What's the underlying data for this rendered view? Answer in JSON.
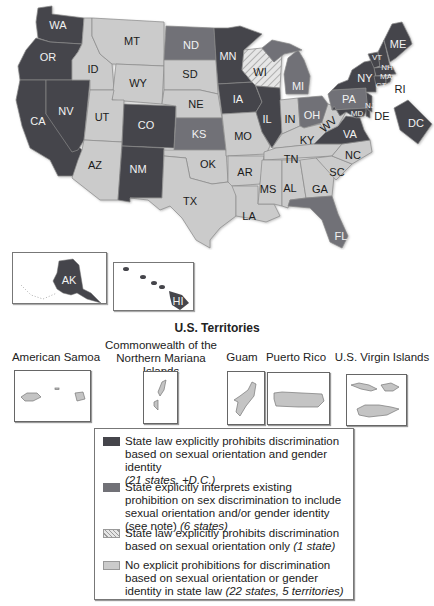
{
  "map": {
    "colors": {
      "dark": "#45454b",
      "medium": "#717177",
      "light": "#cbcbcb",
      "hatched": "hatch-pattern"
    },
    "states": {
      "WA": {
        "label": "WA",
        "category": "dark"
      },
      "OR": {
        "label": "OR",
        "category": "dark"
      },
      "CA": {
        "label": "CA",
        "category": "dark"
      },
      "NV": {
        "label": "NV",
        "category": "dark"
      },
      "ID": {
        "label": "ID",
        "category": "light"
      },
      "MT": {
        "label": "MT",
        "category": "light"
      },
      "WY": {
        "label": "WY",
        "category": "light"
      },
      "UT": {
        "label": "UT",
        "category": "light"
      },
      "AZ": {
        "label": "AZ",
        "category": "light"
      },
      "CO": {
        "label": "CO",
        "category": "dark"
      },
      "NM": {
        "label": "NM",
        "category": "dark"
      },
      "ND": {
        "label": "ND",
        "category": "medium"
      },
      "SD": {
        "label": "SD",
        "category": "light"
      },
      "NE": {
        "label": "NE",
        "category": "light"
      },
      "KS": {
        "label": "KS",
        "category": "medium"
      },
      "OK": {
        "label": "OK",
        "category": "light"
      },
      "TX": {
        "label": "TX",
        "category": "light"
      },
      "MN": {
        "label": "MN",
        "category": "dark"
      },
      "IA": {
        "label": "IA",
        "category": "dark"
      },
      "MO": {
        "label": "MO",
        "category": "light"
      },
      "AR": {
        "label": "AR",
        "category": "light"
      },
      "LA": {
        "label": "LA",
        "category": "light"
      },
      "WI": {
        "label": "WI",
        "category": "hatched"
      },
      "IL": {
        "label": "IL",
        "category": "dark"
      },
      "MI": {
        "label": "MI",
        "category": "medium"
      },
      "IN": {
        "label": "IN",
        "category": "light"
      },
      "OH": {
        "label": "OH",
        "category": "medium"
      },
      "KY": {
        "label": "KY",
        "category": "light"
      },
      "TN": {
        "label": "TN",
        "category": "light"
      },
      "MS": {
        "label": "MS",
        "category": "light"
      },
      "AL": {
        "label": "AL",
        "category": "light"
      },
      "GA": {
        "label": "GA",
        "category": "light"
      },
      "FL": {
        "label": "FL",
        "category": "medium"
      },
      "SC": {
        "label": "SC",
        "category": "light"
      },
      "NC": {
        "label": "NC",
        "category": "light"
      },
      "VA": {
        "label": "VA",
        "category": "dark"
      },
      "WV": {
        "label": "WV",
        "category": "light"
      },
      "PA": {
        "label": "PA",
        "category": "medium"
      },
      "MD": {
        "label": "MD",
        "category": "dark"
      },
      "DE": {
        "label": "DE",
        "category": "dark"
      },
      "NJ": {
        "label": "NJ",
        "category": "dark"
      },
      "NY": {
        "label": "NY",
        "category": "dark"
      },
      "CT": {
        "label": "CT",
        "category": "dark"
      },
      "RI": {
        "label": "RI",
        "category": "dark"
      },
      "MA": {
        "label": "MA",
        "category": "dark"
      },
      "NH": {
        "label": "NH",
        "category": "dark"
      },
      "VT": {
        "label": "VT",
        "category": "dark"
      },
      "ME": {
        "label": "ME",
        "category": "dark"
      },
      "DC": {
        "label": "DC",
        "category": "dark"
      },
      "AK": {
        "label": "AK",
        "category": "dark"
      },
      "HI": {
        "label": "HI",
        "category": "dark"
      }
    }
  },
  "territories": {
    "title": "U.S. Territories",
    "items": [
      {
        "name_line1": "American Samoa",
        "name_line2": "",
        "category": "light"
      },
      {
        "name_line1": "Commonwealth of the",
        "name_line2": "Northern Mariana Islands",
        "category": "light"
      },
      {
        "name_line1": "Guam",
        "name_line2": "",
        "category": "light"
      },
      {
        "name_line1": "Puerto Rico",
        "name_line2": "",
        "category": "light"
      },
      {
        "name_line1": "U.S. Virgin Islands",
        "name_line2": "",
        "category": "light"
      }
    ]
  },
  "legend": {
    "items": [
      {
        "category": "dark",
        "text": "State law explicitly prohibits discrimination based on sexual orientation and gender identity",
        "note": "(21 states, +D.C.)"
      },
      {
        "category": "medium",
        "text": "State explicitly interprets existing prohibition on sex discrimination to include sexual orientation and/or gender identity (see note)",
        "note": "(6 states)"
      },
      {
        "category": "hatched",
        "text": "State law explicitly prohibits discrimination based on sexual orientation only",
        "note": "(1 state)"
      },
      {
        "category": "light",
        "text": "No explicit prohibitions for discrimination based on sexual orientation or gender identity in state law",
        "note": "(22 states, 5 territories)"
      }
    ]
  }
}
